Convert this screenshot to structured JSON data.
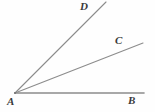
{
  "figure": {
    "kind": "geometry-angle-diagram",
    "width": 155,
    "height": 112,
    "background_color": "#fefefe",
    "line_color": "#8c8c8c",
    "label_color": "#3a3a3a",
    "line_width": 1.1,
    "points": {
      "A": {
        "label": "A",
        "x": 15,
        "y": 93
      },
      "B": {
        "label": "B",
        "x": 144,
        "y": 93
      },
      "C": {
        "label": "C",
        "x": 143,
        "y": 43
      },
      "D": {
        "label": "D",
        "x": 106,
        "y": 2
      }
    },
    "rays": [
      {
        "name": "ray-AB",
        "from": "A",
        "to": "B",
        "x1": 15,
        "y1": 93,
        "x2": 144,
        "y2": 93
      },
      {
        "name": "ray-AC",
        "from": "A",
        "to": "C",
        "x1": 15,
        "y1": 93,
        "x2": 143,
        "y2": 43
      },
      {
        "name": "ray-AD",
        "from": "A",
        "to": "D",
        "x1": 15,
        "y1": 93,
        "x2": 106,
        "y2": 2
      }
    ]
  }
}
